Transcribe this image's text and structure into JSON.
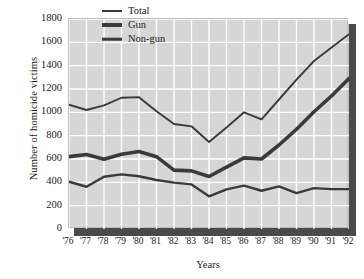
{
  "chart_data": {
    "type": "line",
    "title": "",
    "xlabel": "Years",
    "ylabel": "Number of homicide victims",
    "categories": [
      "'76",
      "'77",
      "'78",
      "'79",
      "'80",
      "'81",
      "'82",
      "'83",
      "'84",
      "'85",
      "'86",
      "'87",
      "'88",
      "'89",
      "'90",
      "'91",
      "'92"
    ],
    "ylim": [
      0,
      1800
    ],
    "yticks": [
      0,
      200,
      400,
      600,
      800,
      1000,
      1200,
      1400,
      1600,
      1800
    ],
    "grid": true,
    "legend_position": "top-center",
    "series": [
      {
        "name": "Total",
        "values": [
          1065,
          1020,
          1060,
          1125,
          1130,
          1010,
          900,
          880,
          745,
          870,
          1000,
          940,
          1110,
          1280,
          1440,
          1555,
          1670
        ]
      },
      {
        "name": "Gun",
        "values": [
          620,
          638,
          598,
          640,
          665,
          620,
          505,
          498,
          450,
          530,
          610,
          600,
          720,
          855,
          1005,
          1140,
          1290
        ]
      },
      {
        "name": "Non-gun",
        "values": [
          405,
          362,
          448,
          468,
          452,
          420,
          398,
          382,
          280,
          340,
          372,
          328,
          365,
          308,
          350,
          342,
          342
        ]
      }
    ]
  },
  "legend": {
    "items": [
      {
        "label": "Total",
        "thickness": 2,
        "color": "#3a3a3a"
      },
      {
        "label": "Gun",
        "thickness": 4,
        "color": "#3a3a3a"
      },
      {
        "label": "Non-gun",
        "thickness": 2.6,
        "color": "#3a3a3a"
      }
    ]
  },
  "colors": {
    "plot_background": "#d6d6d6",
    "gridline": "#ffffff",
    "line": "#3a3a3a",
    "shadow": "#4a4a4a",
    "text": "#1a1a1a"
  }
}
